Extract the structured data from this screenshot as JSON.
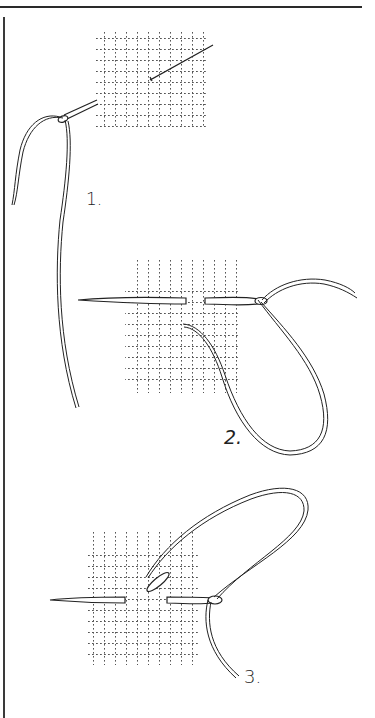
{
  "figure": {
    "colors": {
      "ink": "#222222",
      "paper": "#ffffff",
      "grid": "#555555"
    },
    "steps": [
      {
        "id": 1,
        "label": "1.",
        "caption_icon": "needle-through-canvas-icon"
      },
      {
        "id": 2,
        "label": "2.",
        "caption_icon": "needle-horizontal-stitch-icon"
      },
      {
        "id": 3,
        "label": "3.",
        "caption_icon": "needle-stitch-completed-icon"
      }
    ]
  }
}
